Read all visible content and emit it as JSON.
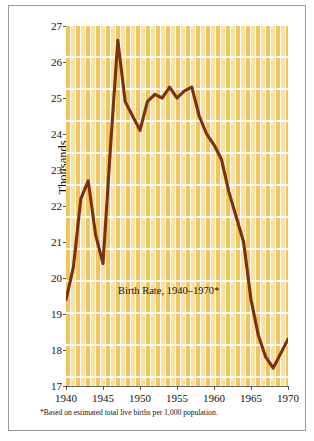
{
  "figure": {
    "copyright": "© Cengage Learning",
    "title": "Birth Rate, 1940–1970*",
    "footnote": "*Based on estimated total live births per 1,000 population."
  },
  "colors": {
    "line": "#7B3010",
    "grid_bar_dark": "#F0C559",
    "grid_bar_light": "#FBE0A3",
    "grid_line": "#FFFFFF",
    "axis": "#666666",
    "frame": "#9A9A9A",
    "text": "#111111"
  },
  "chart_data": {
    "type": "line",
    "title": "Birth Rate, 1940–1970*",
    "xlabel": "",
    "ylabel": "Thousands",
    "xlim": [
      1940,
      1970
    ],
    "ylim": [
      17,
      27
    ],
    "grid": true,
    "legend": null,
    "ytick_labels": [
      "27",
      "26",
      "25",
      "24",
      "23",
      "22",
      "21",
      "20",
      "19",
      "18",
      "17"
    ],
    "yticks": [
      27,
      26,
      25,
      24,
      23,
      22,
      21,
      20,
      19,
      18,
      17
    ],
    "xtick_labels": [
      "1940",
      "1945",
      "1950",
      "1955",
      "1960",
      "1965",
      "1970"
    ],
    "xticks": [
      1940,
      1945,
      1950,
      1955,
      1960,
      1965,
      1970
    ],
    "annotations": [
      {
        "text": "Birth Rate, 1940–1970*",
        "x": 1950.5,
        "y": 19.8
      }
    ],
    "series": [
      {
        "name": "Birth Rate",
        "color": "#7B3010",
        "x": [
          1940,
          1941,
          1942,
          1943,
          1944,
          1945,
          1946,
          1947,
          1948,
          1949,
          1950,
          1951,
          1952,
          1953,
          1954,
          1955,
          1956,
          1957,
          1958,
          1959,
          1960,
          1961,
          1962,
          1963,
          1964,
          1965,
          1966,
          1967,
          1968,
          1969,
          1970
        ],
        "values": [
          19.4,
          20.3,
          22.2,
          22.7,
          21.2,
          20.4,
          23.6,
          26.6,
          24.9,
          24.5,
          24.1,
          24.9,
          25.1,
          25.0,
          25.3,
          25.0,
          25.2,
          25.3,
          24.5,
          24.0,
          23.7,
          23.3,
          22.4,
          21.7,
          21.0,
          19.4,
          18.4,
          17.8,
          17.5,
          17.9,
          18.3
        ]
      }
    ]
  }
}
